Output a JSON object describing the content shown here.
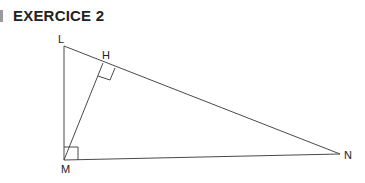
{
  "header": {
    "title": "EXERCICE 2"
  },
  "diagram": {
    "points": {
      "L": {
        "label": "L",
        "x": 64,
        "y": 46
      },
      "H": {
        "label": "H",
        "x": 103,
        "y": 63
      },
      "M": {
        "label": "M",
        "x": 64,
        "y": 160
      },
      "N": {
        "label": "N",
        "x": 340,
        "y": 154
      }
    },
    "segments": [
      "LM",
      "LN",
      "MN",
      "MH"
    ],
    "right_angles": [
      "M",
      "H"
    ],
    "line_color": "#4a4a4a"
  }
}
